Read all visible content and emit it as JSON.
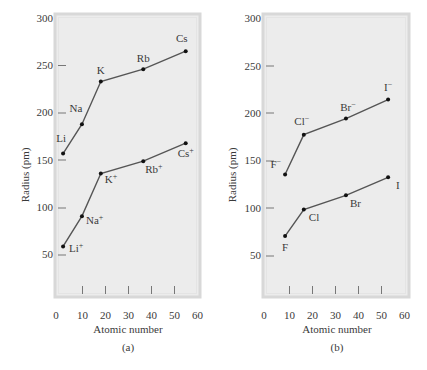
{
  "chart_data": [
    {
      "type": "line",
      "panel_label": "(a)",
      "title": "",
      "xlabel": "Atomic number",
      "ylabel": "Radius (pm)",
      "xlim": [
        0,
        60
      ],
      "ylim": [
        0,
        300
      ],
      "xticks": [
        0,
        10,
        20,
        30,
        40,
        50,
        60
      ],
      "yticks": [
        50,
        100,
        150,
        200,
        250,
        300
      ],
      "grid": false,
      "series": [
        {
          "name": "Atoms",
          "x": [
            3,
            11,
            19,
            37,
            55
          ],
          "y": [
            157,
            188,
            233,
            246,
            265
          ],
          "labels": [
            "Li",
            "Na",
            "K",
            "Rb",
            "Cs"
          ]
        },
        {
          "name": "Cations",
          "x": [
            3,
            11,
            19,
            37,
            55
          ],
          "y": [
            59,
            91,
            136,
            149,
            168
          ],
          "labels": [
            "Li+",
            "Na+",
            "K+",
            "Rb+",
            "Cs+"
          ]
        }
      ]
    },
    {
      "type": "line",
      "panel_label": "(b)",
      "title": "",
      "xlabel": "Atomic number",
      "ylabel": "Radius (pm)",
      "xlim": [
        0,
        60
      ],
      "ylim": [
        0,
        300
      ],
      "xticks": [
        0,
        10,
        20,
        30,
        40,
        50,
        60
      ],
      "yticks": [
        50,
        100,
        150,
        200,
        250,
        300
      ],
      "grid": false,
      "series": [
        {
          "name": "Anions",
          "x": [
            9,
            17,
            35,
            53
          ],
          "y": [
            136,
            178,
            195,
            215
          ],
          "labels": [
            "F−",
            "Cl−",
            "Br−",
            "I−"
          ]
        },
        {
          "name": "Atoms",
          "x": [
            9,
            17,
            35,
            53
          ],
          "y": [
            71,
            99,
            114,
            133
          ],
          "labels": [
            "F",
            "Cl",
            "Br",
            "I"
          ]
        }
      ]
    }
  ],
  "panels": {
    "a": {
      "ylabel": "Radius (pm)",
      "xlabel": "Atomic number",
      "caption": "(a)",
      "yticks": [
        "50",
        "100",
        "150",
        "200",
        "250",
        "300"
      ],
      "xticks": [
        "0",
        "10",
        "20",
        "30",
        "40",
        "50",
        "60"
      ],
      "atoms": {
        "Li": "Li",
        "Na": "Na",
        "K": "K",
        "Rb": "Rb",
        "Cs": "Cs"
      },
      "ions": {
        "Li": "Li",
        "Na": "Na",
        "K": "K",
        "Rb": "Rb",
        "Cs": "Cs",
        "sup": "+"
      }
    },
    "b": {
      "ylabel": "Radius (pm)",
      "xlabel": "Atomic number",
      "caption": "(b)",
      "yticks": [
        "50",
        "100",
        "150",
        "200",
        "250",
        "300"
      ],
      "xticks": [
        "0",
        "10",
        "20",
        "30",
        "40",
        "50",
        "60"
      ],
      "ions": {
        "F": "F",
        "Cl": "Cl",
        "Br": "Br",
        "I": "I",
        "sup": "−"
      },
      "atoms": {
        "F": "F",
        "Cl": "Cl",
        "Br": "Br",
        "I": "I"
      }
    }
  },
  "colors": {
    "panel_fill": "#ececec",
    "panel_border": "#d6d6d6",
    "line": "#555555",
    "point": "#111111",
    "text": "#3a3a3a"
  }
}
